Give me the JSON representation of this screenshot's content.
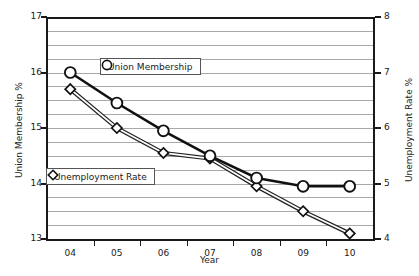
{
  "chart_data": {
    "type": "line",
    "title": "",
    "xlabel": "Year",
    "categories": [
      "04",
      "05",
      "06",
      "07",
      "08",
      "09",
      "10"
    ],
    "grid": true,
    "legend_position": "inside-plot",
    "axes": {
      "left": {
        "label": "Union Membership %",
        "ylim": [
          13,
          17
        ],
        "ticks": [
          "13",
          "14",
          "15",
          "16",
          "17"
        ],
        "tick_values": [
          13,
          14,
          15,
          16,
          17
        ],
        "minor_gridline_step": 0.25
      },
      "right": {
        "label": "Unemployment Rate %",
        "ylim": [
          4,
          8
        ],
        "ticks": [
          "4",
          "5",
          "6",
          "7",
          "8"
        ],
        "tick_values": [
          4,
          5,
          6,
          7,
          8
        ]
      }
    },
    "series": [
      {
        "name": "Union Membership",
        "axis": "left",
        "marker": "circle",
        "values": [
          16.0,
          15.45,
          14.95,
          14.5,
          14.1,
          13.95,
          13.95
        ]
      },
      {
        "name": "Unemployment Rate",
        "axis": "right",
        "marker": "diamond",
        "values": [
          6.7,
          6.0,
          5.55,
          5.45,
          4.95,
          4.5,
          4.1
        ]
      }
    ]
  },
  "legend": {
    "items": [
      {
        "label": "Union Membership",
        "marker": "circle"
      },
      {
        "label": "Unemployment Rate",
        "marker": "diamond"
      }
    ]
  },
  "colors": {
    "axis": "#1a1a1a",
    "gridline": "#a9a9a9",
    "series_primary": "#111111",
    "series_secondary": "#333333",
    "background": "#ffffff"
  }
}
